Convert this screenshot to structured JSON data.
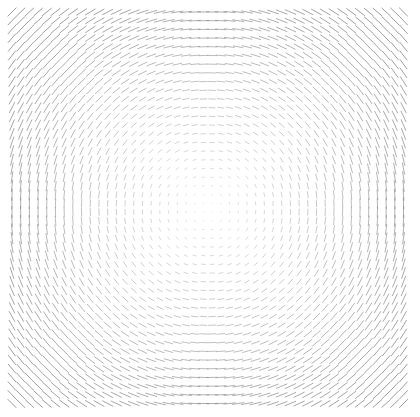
{
  "figure": {
    "title": "",
    "width": 420,
    "height": 417,
    "background_color": "#ffffff"
  },
  "chart_data": {
    "type": "quiver",
    "title": "",
    "subtitle": "",
    "xlabel": "",
    "ylabel": "",
    "legend": [],
    "annotations": [],
    "grid": false,
    "axes_visible": false,
    "tick_labels_x": [],
    "tick_labels_y": [],
    "field_kind": "tangential-vortex",
    "rotation_sense": "clockwise",
    "vector_style": "headless-segment",
    "center_x": 208,
    "center_y": 208,
    "plot_left": 12,
    "plot_top": 12,
    "plot_right": 406,
    "plot_bottom": 403,
    "grid_pitch": 8.7,
    "grid_cols": 46,
    "grid_rows": 46,
    "xlim": [
      -1.0,
      1.0
    ],
    "ylim": [
      -1.0,
      1.0
    ],
    "magnitude_model": "linear-in-radius",
    "magnitude_min": 0.0,
    "magnitude_max": 1.0,
    "max_segment_length_px": 11.5,
    "min_segment_length_px": 0.6,
    "stroke_color": "#808080",
    "stroke_width": 1.0,
    "opacity_min": 0.16,
    "opacity_max": 0.78,
    "sample_vectors": [
      {
        "x": 12,
        "y": 12,
        "angle_deg": 45,
        "magnitude": 1.0
      },
      {
        "x": 208,
        "y": 12,
        "angle_deg": 0,
        "magnitude": 0.7
      },
      {
        "x": 406,
        "y": 12,
        "angle_deg": -45,
        "magnitude": 1.0
      },
      {
        "x": 12,
        "y": 208,
        "angle_deg": 90,
        "magnitude": 0.7
      },
      {
        "x": 208,
        "y": 208,
        "angle_deg": 0,
        "magnitude": 0.0
      },
      {
        "x": 406,
        "y": 208,
        "angle_deg": 90,
        "magnitude": 0.7
      },
      {
        "x": 12,
        "y": 403,
        "angle_deg": -45,
        "magnitude": 1.0
      },
      {
        "x": 208,
        "y": 403,
        "angle_deg": 0,
        "magnitude": 0.7
      },
      {
        "x": 406,
        "y": 403,
        "angle_deg": 45,
        "magnitude": 1.0
      }
    ]
  }
}
